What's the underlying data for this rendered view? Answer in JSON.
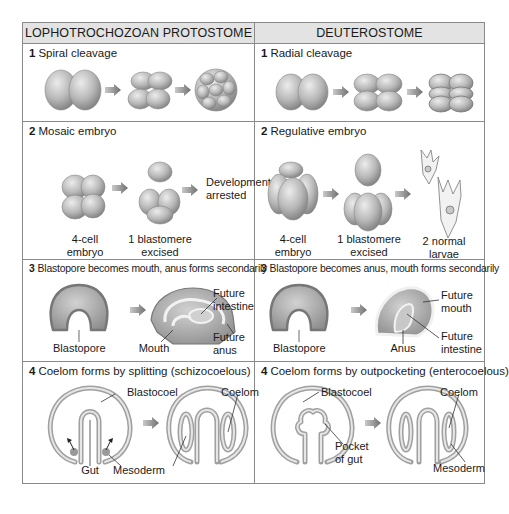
{
  "columns": [
    {
      "header": "LOPHOTROCHOZOAN PROTOSTOME"
    },
    {
      "header": "DEUTEROSTOME"
    }
  ],
  "rows": [
    {
      "protostome": {
        "number": "1",
        "title": "Spiral cleavage",
        "labels": []
      },
      "deuterostome": {
        "number": "1",
        "title": "Radial cleavage",
        "labels": []
      }
    },
    {
      "protostome": {
        "number": "2",
        "title": "Mosaic embryo",
        "labels": {
          "a": "4-cell\nembryo",
          "b": "1 blastomere\nexcised",
          "c": "Development\narrested"
        }
      },
      "deuterostome": {
        "number": "2",
        "title": "Regulative embryo",
        "labels": {
          "a": "4-cell\nembryo",
          "b": "1 blastomere\nexcised",
          "c": "2 normal\nlarvae"
        }
      }
    },
    {
      "protostome": {
        "number": "3",
        "title": "Blastopore becomes mouth, anus forms secondarily",
        "labels": {
          "blastopore": "Blastopore",
          "mouth": "Mouth",
          "future_intestine": "Future\nintestine",
          "future_anus": "Future\nanus"
        }
      },
      "deuterostome": {
        "number": "3",
        "title": "Blastopore becomes anus, mouth forms secondarily",
        "labels": {
          "blastopore": "Blastopore",
          "anus": "Anus",
          "future_mouth": "Future\nmouth",
          "future_intestine": "Future\nintestine"
        }
      }
    },
    {
      "protostome": {
        "number": "4",
        "title": "Coelom forms by splitting (schizocoelous)",
        "labels": {
          "blastocoel": "Blastocoel",
          "coelom": "Coelom",
          "gut": "Gut",
          "mesoderm": "Mesoderm"
        }
      },
      "deuterostome": {
        "number": "4",
        "title": "Coelom forms by outpocketing (enterocoelous)",
        "labels": {
          "blastocoel": "Blastocoel",
          "coelom": "Coelom",
          "pocket_of_gut": "Pocket\nof gut",
          "mesoderm": "Mesoderm"
        }
      }
    }
  ],
  "colors": {
    "border": "#8a8a8a",
    "header_bg": "#e3e3e3",
    "cell_fill": "#b5b5b5",
    "arrow": "#8c8c8c"
  }
}
